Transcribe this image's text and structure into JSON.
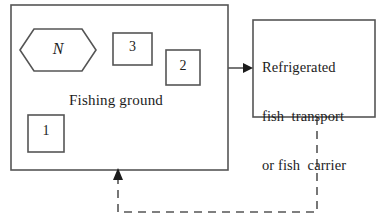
{
  "diagram": {
    "fishing_ground": {
      "label": "Fishing ground",
      "north_marker": "N",
      "vessels": [
        {
          "id": "vessel-1",
          "number": "1"
        },
        {
          "id": "vessel-2",
          "number": "2"
        },
        {
          "id": "vessel-3",
          "number": "3"
        }
      ]
    },
    "transport": {
      "line1": "Refrigerated",
      "line2": "fish  transport",
      "line3": "or fish  carrier"
    },
    "flows": {
      "catch_delivery": "solid-arrow-right",
      "vessel_return": "dashed-arrow-return"
    },
    "colors": {
      "stroke": "#555555",
      "text": "#1c1c1c",
      "background": "#ffffff"
    }
  }
}
